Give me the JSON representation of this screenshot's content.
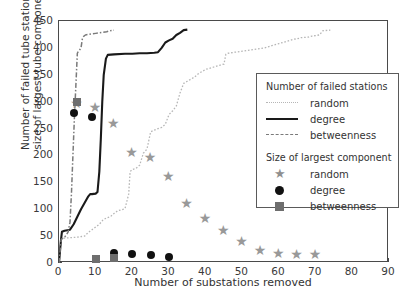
{
  "chart_data": {
    "type": "line",
    "title": "",
    "xlabel": "Number of substations removed",
    "ylabel": "Number of failed tube stations/ size of largest tube component",
    "ylabel_line1": "Number of failed tube stations/",
    "ylabel_line2": "size of largest tube component",
    "xlim": [
      0,
      90
    ],
    "ylim": [
      0,
      450
    ],
    "xticks": [
      0,
      10,
      20,
      30,
      40,
      50,
      60,
      70,
      80,
      90
    ],
    "yticks": [
      0,
      50,
      100,
      150,
      200,
      250,
      300,
      350,
      400,
      450
    ],
    "grid": false,
    "legend_position": "right",
    "colors": {
      "random_line": "#b6b6b6",
      "degree_line": "#1a1a1a",
      "betweenness_line": "#7a7a7a",
      "star_marker": "#999999",
      "circle_marker": "#111111",
      "square_marker": "#6e6e6e",
      "axis": "#4a4a4a",
      "background": "#ffffff"
    },
    "series": [
      {
        "name": "random",
        "group": "Number of failed stations",
        "style": "dotted",
        "points": [
          [
            0,
            0
          ],
          [
            0.6,
            46
          ],
          [
            3,
            47
          ],
          [
            5,
            48
          ],
          [
            7,
            50
          ],
          [
            8,
            57
          ],
          [
            9,
            62
          ],
          [
            10,
            67
          ],
          [
            11,
            72
          ],
          [
            12,
            80
          ],
          [
            13,
            84
          ],
          [
            14,
            86
          ],
          [
            15,
            92
          ],
          [
            16,
            97
          ],
          [
            17,
            99
          ],
          [
            18,
            101
          ],
          [
            19,
            128
          ],
          [
            19.4,
            170
          ],
          [
            20,
            174
          ],
          [
            21,
            176
          ],
          [
            22,
            182
          ],
          [
            23,
            204
          ],
          [
            24,
            212
          ],
          [
            25,
            244
          ],
          [
            26,
            247
          ],
          [
            27,
            250
          ],
          [
            28,
            252
          ],
          [
            29,
            258
          ],
          [
            30,
            276
          ],
          [
            31,
            283
          ],
          [
            32,
            292
          ],
          [
            33,
            316
          ],
          [
            34,
            334
          ],
          [
            35,
            338
          ],
          [
            36,
            342
          ],
          [
            37,
            346
          ],
          [
            38,
            352
          ],
          [
            39,
            356
          ],
          [
            40,
            360
          ],
          [
            41,
            362
          ],
          [
            42,
            364
          ],
          [
            43,
            366
          ],
          [
            44,
            368
          ],
          [
            45,
            370
          ],
          [
            45.5,
            388
          ],
          [
            46,
            390
          ],
          [
            48,
            392
          ],
          [
            50,
            394
          ],
          [
            52,
            396
          ],
          [
            54,
            398
          ],
          [
            56,
            400
          ],
          [
            58,
            404
          ],
          [
            60,
            408
          ],
          [
            61,
            410
          ],
          [
            62,
            412
          ],
          [
            63,
            414
          ],
          [
            64,
            416
          ],
          [
            65,
            417
          ],
          [
            66,
            419
          ],
          [
            68,
            420
          ],
          [
            69,
            422
          ],
          [
            70,
            423
          ],
          [
            71,
            424
          ],
          [
            72,
            432
          ],
          [
            74,
            433
          ]
        ]
      },
      {
        "name": "degree",
        "group": "Number of failed stations",
        "style": "solid",
        "points": [
          [
            0,
            0
          ],
          [
            0.5,
            40
          ],
          [
            0.8,
            58
          ],
          [
            1.5,
            60
          ],
          [
            3,
            62
          ],
          [
            4,
            72
          ],
          [
            5,
            86
          ],
          [
            6,
            100
          ],
          [
            7,
            112
          ],
          [
            8,
            124
          ],
          [
            8.5,
            128
          ],
          [
            9,
            128
          ],
          [
            10,
            129
          ],
          [
            10.5,
            132
          ],
          [
            11,
            170
          ],
          [
            11.4,
            230
          ],
          [
            11.8,
            300
          ],
          [
            12.2,
            350
          ],
          [
            12.8,
            380
          ],
          [
            13.3,
            387
          ],
          [
            15,
            388
          ],
          [
            18,
            389
          ],
          [
            20,
            389
          ],
          [
            22,
            390
          ],
          [
            24,
            390
          ],
          [
            26,
            391
          ],
          [
            27,
            392
          ],
          [
            28,
            400
          ],
          [
            29,
            410
          ],
          [
            30,
            414
          ],
          [
            31,
            417
          ],
          [
            32,
            424
          ],
          [
            33,
            428
          ],
          [
            34,
            433
          ],
          [
            35,
            434
          ]
        ]
      },
      {
        "name": "betweenness",
        "group": "Number of failed stations",
        "style": "dashdot",
        "points": [
          [
            0,
            0
          ],
          [
            0.6,
            44
          ],
          [
            1.5,
            48
          ],
          [
            2,
            52
          ],
          [
            2.5,
            58
          ],
          [
            3,
            76
          ],
          [
            3.4,
            130
          ],
          [
            3.8,
            200
          ],
          [
            4.2,
            270
          ],
          [
            4.6,
            330
          ],
          [
            5,
            390
          ],
          [
            5.3,
            394
          ],
          [
            5.6,
            396
          ],
          [
            5.8,
            398
          ],
          [
            6,
            400
          ],
          [
            6.4,
            418
          ],
          [
            6.8,
            422
          ],
          [
            7.2,
            424
          ],
          [
            8,
            425
          ],
          [
            9,
            426
          ],
          [
            10,
            427
          ],
          [
            11,
            428
          ],
          [
            12,
            429
          ],
          [
            13,
            430
          ],
          [
            14,
            432
          ],
          [
            15,
            433
          ]
        ]
      }
    ],
    "marker_series": [
      {
        "name": "random",
        "group": "Size of largest component",
        "marker": "star",
        "points": [
          [
            5,
            297
          ],
          [
            10,
            291
          ],
          [
            15,
            261
          ],
          [
            20,
            207
          ],
          [
            25,
            197
          ],
          [
            30,
            161
          ],
          [
            35,
            111
          ],
          [
            40,
            84
          ],
          [
            45,
            62
          ],
          [
            50,
            40
          ],
          [
            55,
            24
          ],
          [
            60,
            19
          ],
          [
            65,
            17
          ],
          [
            70,
            16
          ]
        ]
      },
      {
        "name": "degree",
        "group": "Size of largest component",
        "marker": "circle",
        "points": [
          [
            4,
            278
          ],
          [
            9,
            272
          ],
          [
            15,
            18
          ],
          [
            20,
            16
          ],
          [
            25,
            15
          ],
          [
            30,
            12
          ]
        ]
      },
      {
        "name": "betweenness",
        "group": "Size of largest component",
        "marker": "square",
        "points": [
          [
            5,
            300
          ],
          [
            10,
            8
          ],
          [
            15,
            10
          ]
        ]
      }
    ]
  },
  "legend": {
    "section1_title": "Number of failed stations",
    "section2_title": "Size of largest component",
    "entries1": [
      {
        "label": "random",
        "key": "dotted-line-key"
      },
      {
        "label": "degree",
        "key": "solid-line-key"
      },
      {
        "label": "betweenness",
        "key": "dashdot-line-key"
      }
    ],
    "entries2": [
      {
        "label": "random",
        "key": "star-marker-key"
      },
      {
        "label": "degree",
        "key": "circle-marker-key"
      },
      {
        "label": "betweenness",
        "key": "square-marker-key"
      }
    ]
  }
}
